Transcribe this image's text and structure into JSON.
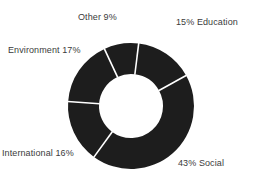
{
  "chart_data": {
    "type": "pie",
    "variant": "donut",
    "title": "",
    "subtitle": "",
    "xlabel": "",
    "ylabel": "",
    "grid": false,
    "legend": "none",
    "labels_inline": true,
    "unit": "%",
    "total": 100,
    "categories": [
      "Education",
      "Social",
      "International",
      "Environment",
      "Other"
    ],
    "values": [
      15,
      43,
      16,
      17,
      9
    ],
    "slices": [
      {
        "name": "Education",
        "value": 15,
        "label": "15% Education",
        "label_position": "top-right",
        "start_angle_deg": 7,
        "end_angle_deg": 61,
        "color": "#1d1d1d"
      },
      {
        "name": "Social",
        "value": 43,
        "label": "43% Social",
        "label_position": "bottom-right",
        "start_angle_deg": 61,
        "end_angle_deg": 216,
        "color": "#1d1d1d"
      },
      {
        "name": "International",
        "value": 16,
        "label": "International 16%",
        "label_position": "bottom-left",
        "start_angle_deg": 216,
        "end_angle_deg": 274,
        "color": "#1d1d1d"
      },
      {
        "name": "Environment",
        "value": 17,
        "label": "Environment 17%",
        "label_position": "left",
        "start_angle_deg": 274,
        "end_angle_deg": 335,
        "color": "#1d1d1d"
      },
      {
        "name": "Other",
        "value": 9,
        "label": "Other 9%",
        "label_position": "top-left",
        "start_angle_deg": 335,
        "end_angle_deg": 367,
        "color": "#1d1d1d"
      }
    ],
    "geometry": {
      "center_x": 131,
      "center_y": 106,
      "outer_radius": 63,
      "inner_radius": 32,
      "separator_color": "#ffffff",
      "separator_width": 1.6,
      "background": "#ffffff"
    },
    "colors": {
      "slice_fill": "#1d1d1d",
      "label_text": "#3b3b3b",
      "background": "#ffffff"
    }
  }
}
